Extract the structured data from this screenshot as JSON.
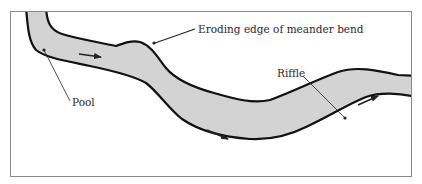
{
  "figure": {
    "type": "river meander diagram",
    "colors": {
      "background": "#ffffff",
      "frame": "#8a8a8a",
      "channel_fill": "#d3d3d3",
      "bank_line": "#111111",
      "leader_line": "#222222",
      "arrow": "#222222",
      "label_text": "#2a2a2a"
    },
    "labels": {
      "eroding_edge": "Eroding edge of meander bend",
      "pool": "Pool",
      "riffle": "Riffle"
    },
    "flow_arrows_count": 3
  }
}
